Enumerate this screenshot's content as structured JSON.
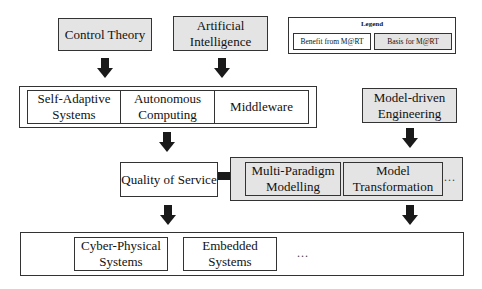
{
  "diagram": {
    "top_row": {
      "control_theory": "Control Theory",
      "artificial_intelligence": "Artificial Intelligence"
    },
    "legend": {
      "title": "Legend",
      "benefit": "Benefit from M@RT",
      "basis": "Basis for M@RT"
    },
    "row2": {
      "self_adaptive": "Self-Adaptive Systems",
      "autonomous": "Autonomous Computing",
      "middleware": "Middleware",
      "model_driven": "Model-driven Engineering"
    },
    "row3": {
      "qos": "Quality of Service",
      "multi_paradigm": "Multi-Paradigm Modelling",
      "model_transformation": "Model Transformation",
      "ellipsis": "..."
    },
    "row4": {
      "cyber_physical": "Cyber-Physical Systems",
      "embedded": "Embedded Systems",
      "ellipsis": "..."
    },
    "colors": {
      "basis_fill": "#e4e4e4",
      "benefit_fill": "#ffffff",
      "border": "#333333",
      "arrow": "#1a1a1a"
    }
  }
}
